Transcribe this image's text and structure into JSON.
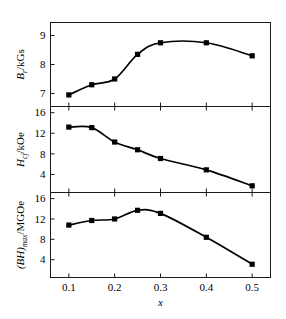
{
  "figure": {
    "xlabel": "x",
    "xticks": [
      "0.1",
      "0.2",
      "0.3",
      "0.4",
      "0.5"
    ]
  },
  "panels": {
    "top": {
      "ylabel_symbol": "B",
      "ylabel_sub": "r",
      "ylabel_unit": "/kGs",
      "yticks": [
        "7",
        "8",
        "9"
      ]
    },
    "middle": {
      "ylabel_symbol": "H",
      "ylabel_sub": "cj",
      "ylabel_unit": "/kOe",
      "yticks": [
        "4",
        "8",
        "12",
        "16"
      ]
    },
    "bottom": {
      "ylabel_symbol": "(BH)",
      "ylabel_sub": "max",
      "ylabel_unit": "/MGOe",
      "yticks": [
        "4",
        "8",
        "12",
        "16"
      ]
    }
  },
  "chart_data": [
    {
      "type": "line",
      "panel": "top",
      "title": "",
      "xlabel": "x",
      "ylabel": "Br/kGs",
      "x": [
        0.1,
        0.15,
        0.2,
        0.25,
        0.3,
        0.4,
        0.5
      ],
      "values": [
        6.95,
        7.3,
        7.5,
        8.35,
        8.75,
        8.75,
        8.3
      ],
      "xlim": [
        0.06,
        0.54
      ],
      "ylim": [
        6.55,
        9.45
      ],
      "xticks": [
        0.1,
        0.2,
        0.3,
        0.4,
        0.5
      ],
      "yticks": [
        7,
        8,
        9
      ],
      "grid": false,
      "legend": "none",
      "marker": "filled-square",
      "smooth": true
    },
    {
      "type": "line",
      "panel": "middle",
      "title": "",
      "xlabel": "x",
      "ylabel": "Hcj/kOe",
      "x": [
        0.1,
        0.15,
        0.2,
        0.25,
        0.3,
        0.4,
        0.5
      ],
      "values": [
        13.2,
        13.1,
        10.3,
        8.8,
        7.1,
        4.9,
        1.8
      ],
      "xlim": [
        0.06,
        0.54
      ],
      "ylim": [
        0.5,
        17.2
      ],
      "xticks": [
        0.1,
        0.2,
        0.3,
        0.4,
        0.5
      ],
      "yticks": [
        4,
        8,
        12,
        16
      ],
      "grid": false,
      "legend": "none",
      "marker": "filled-square",
      "smooth": true
    },
    {
      "type": "line",
      "panel": "bottom",
      "title": "",
      "xlabel": "x",
      "ylabel": "(BH)max/MGOe",
      "x": [
        0.1,
        0.15,
        0.2,
        0.25,
        0.3,
        0.4,
        0.5
      ],
      "values": [
        10.8,
        11.7,
        12.0,
        13.7,
        13.1,
        8.4,
        3.1
      ],
      "xlim": [
        0.06,
        0.54
      ],
      "ylim": [
        0.5,
        17.2
      ],
      "xticks": [
        0.1,
        0.2,
        0.3,
        0.4,
        0.5
      ],
      "yticks": [
        4,
        8,
        12,
        16
      ],
      "grid": false,
      "legend": "none",
      "marker": "filled-square",
      "smooth": true
    }
  ]
}
